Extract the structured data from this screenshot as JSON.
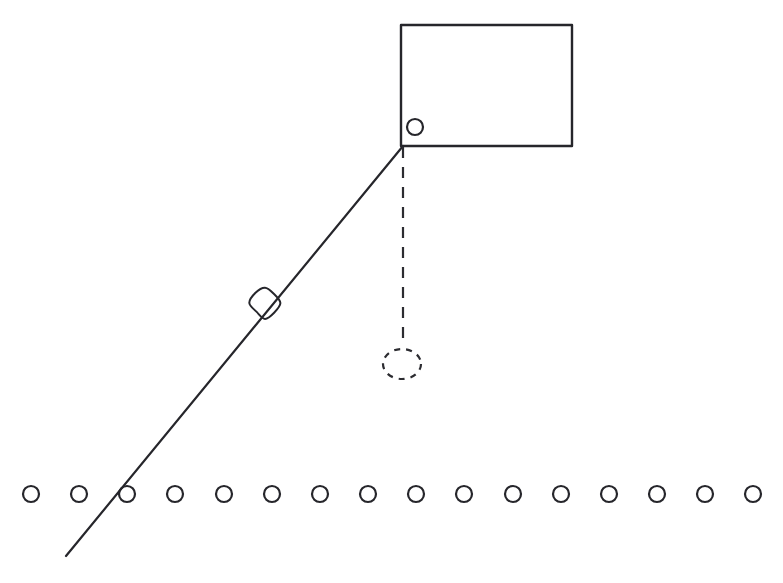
{
  "figure": {
    "title": "Inclined line diagram with block, rollers and dashed plumb line",
    "background_color": "#ffffff",
    "width": 783,
    "height": 583,
    "ink_color": "#26262b",
    "dashed_color": "#2c2c31"
  },
  "chart_data": {
    "type": "diagram",
    "title": "Inclined line diagram with block, rollers and dashed plumb line",
    "xlabel": "",
    "ylabel": "",
    "xlim": [
      0,
      783
    ],
    "ylim": [
      583,
      0
    ],
    "grid": false,
    "legend": "none",
    "elements": [
      {
        "name": "incline-line",
        "kind": "line",
        "label": "Diagonal incline line",
        "x1": 66,
        "y1": 556,
        "x2": 403,
        "y2": 146,
        "stroke_width": 2.2,
        "style": "solid",
        "color": "#26262b"
      },
      {
        "name": "block-rectangle",
        "kind": "rect",
        "label": "Rectangular block",
        "x": 401,
        "y": 25,
        "width": 171,
        "height": 121,
        "stroke_width": 2.4,
        "style": "solid",
        "color": "#26262b",
        "fill": "none"
      },
      {
        "name": "corner-wheel",
        "kind": "circle",
        "label": "Small circle at block lower-left corner",
        "cx": 415,
        "cy": 127,
        "r": 8,
        "stroke_width": 2.2,
        "style": "solid",
        "color": "#26262b",
        "fill": "none"
      },
      {
        "name": "incline-marker-blob",
        "kind": "blob",
        "label": "Hand-drawn marker on the incline",
        "cx": 265,
        "cy": 303,
        "rx": 14,
        "ry": 15,
        "stroke_width": 2.0,
        "style": "solid",
        "color": "#26262b",
        "fill": "none"
      },
      {
        "name": "plumb-dashed-line",
        "kind": "line",
        "label": "Vertical dashed drop line",
        "x1": 403,
        "y1": 147,
        "x2": 403,
        "y2": 344,
        "stroke_width": 2.2,
        "style": "dashed",
        "dash_pattern": "11 9",
        "color": "#2c2c31"
      },
      {
        "name": "dashed-target-ellipse",
        "kind": "ellipse",
        "label": "Dashed circle at end of drop line",
        "cx": 402,
        "cy": 364,
        "rx": 19,
        "ry": 15,
        "stroke_width": 2.2,
        "style": "dashed",
        "dash_pattern": "6 6",
        "color": "#2c2c31",
        "fill": "none"
      }
    ],
    "roller_row": {
      "name": "roller-row",
      "label": "Row of circles along the baseline",
      "count": 16,
      "cy": 494,
      "r": 8,
      "stroke_width": 2.2,
      "color": "#26262b",
      "fill": "none",
      "first_cx": 31,
      "spacing": 48.1,
      "centers_x": [
        31,
        79,
        127,
        175,
        224,
        272,
        320,
        368,
        416,
        464,
        513,
        561,
        609,
        657,
        705,
        753
      ]
    }
  }
}
